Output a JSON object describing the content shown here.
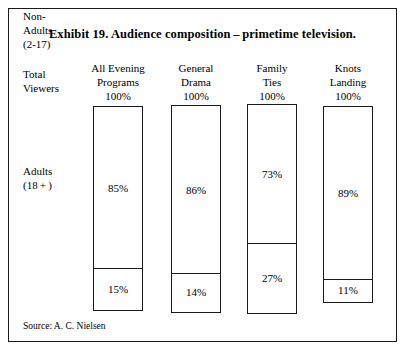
{
  "exhibit": {
    "title": "Exhibit 19. Audience composition – primetime television.",
    "source": "Source: A. C. Nielsen",
    "border_color": "#1a1a1a",
    "background_color": "#ffffff"
  },
  "row_labels": {
    "total_viewers": "Total\nViewers",
    "adults": "Adults\n(18 + )",
    "non_adults": "Non-\nAdults\n(2-17)"
  },
  "chart_data": {
    "type": "bar",
    "xlabel": "",
    "ylabel": "Total Viewers",
    "ylim": [
      0,
      100
    ],
    "grid": false,
    "legend": "none",
    "stacked": true,
    "unit": "%",
    "categories": [
      "All Evening Programs",
      "General Drama",
      "Family Ties",
      "Knots Landing"
    ],
    "category_totals": [
      "100%",
      "100%",
      "100%",
      "100%"
    ],
    "series": [
      {
        "name": "Adults (18+)",
        "values": [
          85,
          86,
          73,
          89
        ],
        "labels": [
          "85%",
          "86%",
          "73%",
          "89%"
        ]
      },
      {
        "name": "Non-Adults (2-17)",
        "values": [
          15,
          14,
          27,
          11
        ],
        "labels": [
          "15%",
          "14%",
          "27%",
          "11%"
        ]
      }
    ],
    "annotations": [
      "Source: A. C. Nielsen"
    ]
  },
  "columns": [
    {
      "header": "All Evening\nPrograms",
      "total": "100%",
      "top_value": "85%",
      "bottom_value": "15%",
      "left": 81,
      "bar_top": 105,
      "bar_height": 205,
      "divider_offset": 162
    },
    {
      "header": "General\nDrama",
      "total": "100%",
      "top_value": "86%",
      "bottom_value": "14%",
      "left": 159,
      "bar_top": 104,
      "bar_height": 208,
      "divider_offset": 168
    },
    {
      "header": "Family\nTies",
      "total": "100%",
      "top_value": "73%",
      "bottom_value": "27%",
      "left": 235,
      "bar_top": 103,
      "bar_height": 210,
      "divider_offset": 139
    },
    {
      "header": "Knots\nLanding",
      "total": "100%",
      "top_value": "89%",
      "bottom_value": "11%",
      "left": 311,
      "bar_top": 105,
      "bar_height": 197,
      "divider_offset": 173
    }
  ]
}
